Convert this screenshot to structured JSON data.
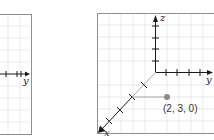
{
  "figure": {
    "left_panel": {
      "axis_label_y": "y"
    },
    "right_panel": {
      "axis_label_x": "x",
      "axis_label_y": "y",
      "axis_label_z": "z",
      "point": {
        "label": "(2, 3, 0)",
        "coords": [
          2,
          3,
          0
        ]
      }
    }
  },
  "colors": {
    "grid": "#e3e3e3",
    "border": "#8f8f8f",
    "axis": "#1a1a1a",
    "projection": "#a8a8a8",
    "point": "#8a8a8a"
  }
}
